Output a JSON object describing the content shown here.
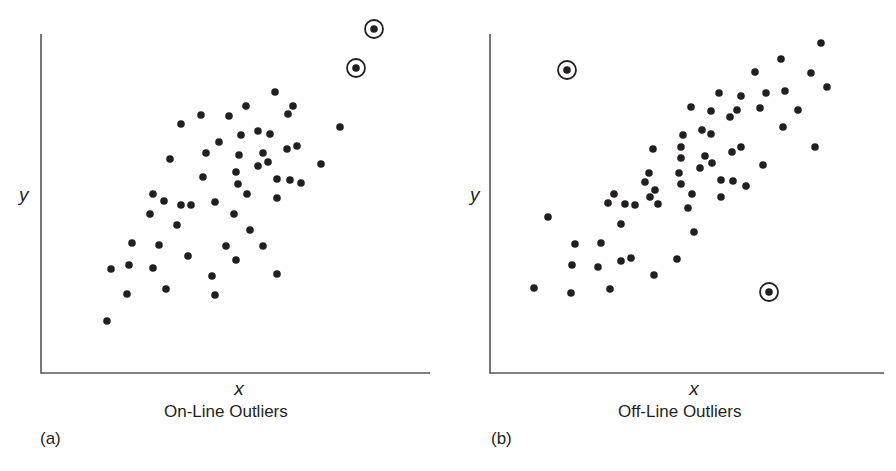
{
  "colors": {
    "ink": "#231f20",
    "axis": "#555555",
    "background": "#ffffff"
  },
  "chart_data": [
    {
      "type": "scatter",
      "panel_letter": "(a)",
      "title": "On-Line Outliers",
      "xlabel": "x",
      "ylabel": "y",
      "grid": false,
      "ticks": false,
      "xlim": [
        0,
        389
      ],
      "ylim": [
        0,
        339
      ],
      "units_note": "coordinates in plot units: x = distance right of y-axis, y = height above x-axis",
      "outliers": [
        [
          333,
          344
        ],
        [
          315,
          305
        ]
      ],
      "points": [
        [
          234,
          281
        ],
        [
          252,
          267
        ],
        [
          247,
          259
        ],
        [
          205,
          267
        ],
        [
          160,
          258
        ],
        [
          188,
          257
        ],
        [
          140,
          249
        ],
        [
          299,
          246
        ],
        [
          217,
          242
        ],
        [
          229,
          239
        ],
        [
          200,
          238
        ],
        [
          178,
          231
        ],
        [
          256,
          227
        ],
        [
          246,
          224
        ],
        [
          165,
          220
        ],
        [
          222,
          220
        ],
        [
          198,
          218
        ],
        [
          227,
          211
        ],
        [
          129,
          214
        ],
        [
          280,
          209
        ],
        [
          217,
          207
        ],
        [
          195,
          201
        ],
        [
          162,
          196
        ],
        [
          236,
          194
        ],
        [
          249,
          193
        ],
        [
          260,
          190
        ],
        [
          197,
          189
        ],
        [
          206,
          179
        ],
        [
          112,
          179
        ],
        [
          236,
          175
        ],
        [
          123,
          172
        ],
        [
          140,
          168
        ],
        [
          150,
          168
        ],
        [
          174,
          171
        ],
        [
          109,
          159
        ],
        [
          193,
          159
        ],
        [
          136,
          148
        ],
        [
          209,
          143
        ],
        [
          91,
          130
        ],
        [
          118,
          128
        ],
        [
          185,
          127
        ],
        [
          222,
          127
        ],
        [
          147,
          117
        ],
        [
          195,
          113
        ],
        [
          70,
          104
        ],
        [
          88,
          108
        ],
        [
          112,
          105
        ],
        [
          171,
          97
        ],
        [
          236,
          99
        ],
        [
          86,
          79
        ],
        [
          125,
          84
        ],
        [
          174,
          78
        ],
        [
          66,
          52
        ]
      ]
    },
    {
      "type": "scatter",
      "panel_letter": "(b)",
      "title": "Off-Line Outliers",
      "xlabel": "x",
      "ylabel": "y",
      "grid": false,
      "ticks": false,
      "xlim": [
        0,
        394
      ],
      "ylim": [
        0,
        339
      ],
      "units_note": "coordinates in plot units: x = distance right of y-axis, y = height above x-axis",
      "outliers": [
        [
          77,
          303
        ],
        [
          279,
          81
        ]
      ],
      "points": [
        [
          331,
          330
        ],
        [
          291,
          314
        ],
        [
          265,
          301
        ],
        [
          321,
          300
        ],
        [
          337,
          286
        ],
        [
          229,
          280
        ],
        [
          251,
          277
        ],
        [
          276,
          280
        ],
        [
          295,
          282
        ],
        [
          201,
          266
        ],
        [
          221,
          262
        ],
        [
          247,
          263
        ],
        [
          270,
          265
        ],
        [
          240,
          256
        ],
        [
          308,
          263
        ],
        [
          293,
          246
        ],
        [
          212,
          243
        ],
        [
          221,
          239
        ],
        [
          193,
          238
        ],
        [
          163,
          224
        ],
        [
          191,
          226
        ],
        [
          251,
          226
        ],
        [
          242,
          221
        ],
        [
          325,
          226
        ],
        [
          191,
          215
        ],
        [
          215,
          217
        ],
        [
          222,
          210
        ],
        [
          210,
          205
        ],
        [
          273,
          208
        ],
        [
          159,
          200
        ],
        [
          189,
          200
        ],
        [
          155,
          191
        ],
        [
          231,
          193
        ],
        [
          243,
          192
        ],
        [
          256,
          187
        ],
        [
          191,
          189
        ],
        [
          165,
          183
        ],
        [
          202,
          179
        ],
        [
          124,
          179
        ],
        [
          160,
          176
        ],
        [
          231,
          176
        ],
        [
          118,
          170
        ],
        [
          135,
          169
        ],
        [
          145,
          168
        ],
        [
          168,
          169
        ],
        [
          198,
          165
        ],
        [
          58,
          156
        ],
        [
          131,
          149
        ],
        [
          204,
          141
        ],
        [
          85,
          129
        ],
        [
          111,
          130
        ],
        [
          82,
          108
        ],
        [
          108,
          106
        ],
        [
          131,
          112
        ],
        [
          141,
          115
        ],
        [
          187,
          114
        ],
        [
          164,
          98
        ],
        [
          44,
          85
        ],
        [
          81,
          80
        ],
        [
          120,
          84
        ]
      ]
    }
  ]
}
